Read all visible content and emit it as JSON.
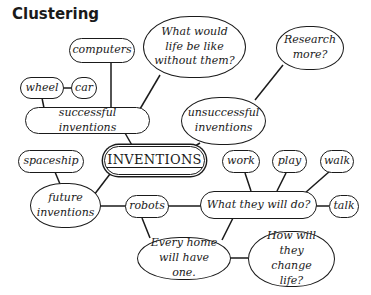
{
  "title": "Clustering",
  "center": "INVENTIONS",
  "nodes": {
    "computers": "computers",
    "what_would": "What would life be like without them?",
    "research": "Research more?",
    "wheel": "wheel",
    "car": "car",
    "successful": "successful inventions",
    "unsuccessful": "unsuccessful inventions",
    "spaceship": "spaceship",
    "work": "work",
    "play": "play",
    "walk": "walk",
    "future": "future inventions",
    "robots": "robots",
    "what_they_do": "What they will do?",
    "talk": "talk",
    "every_home": "Every home will have one.",
    "how_change": "How will they change life?"
  },
  "colors": {
    "ink": "#1a1a1a",
    "background": "#ffffff"
  }
}
